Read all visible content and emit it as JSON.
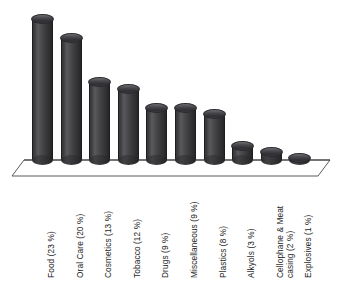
{
  "chart_data": {
    "type": "bar",
    "title": "",
    "subtitle": "",
    "xlabel": "",
    "ylabel": "",
    "grid": false,
    "legend": false,
    "style": "3d-cylinder",
    "ylim": [
      0,
      25
    ],
    "unit": "%",
    "categories": [
      "Food",
      "Oral Care",
      "Cosmetics",
      "Tobacco",
      "Drugs",
      "Miscellaneous",
      "Plastics",
      "Alkyols",
      "Cellophane & Meat casing",
      "Explosives"
    ],
    "values": [
      23,
      20,
      13,
      12,
      9,
      9,
      8,
      3,
      2,
      1
    ],
    "tick_labels": [
      "Food (23 %)",
      "Oral Care (20 %)",
      "Cosmetics (13 %)",
      "Tobacco (12 %)",
      "Drugs (9 %)",
      "Miscellaneous (9 %)",
      "Plastics (8 %)",
      "Alkyols (3 %)",
      "Cellophane & Meat\ncasing (2 %)",
      "Explosives (1 %)"
    ]
  },
  "colors": {
    "bar_dark": "#2e2e31",
    "bar_mid": "#4a4a4d",
    "bar_light": "#5a5a5e",
    "floor_line": "#555555",
    "floor_fill": "#ffffff",
    "text": "#1c1c1c",
    "background": "#ffffff"
  },
  "axis": {
    "baseline_y": 160,
    "floor_depth": 18
  }
}
